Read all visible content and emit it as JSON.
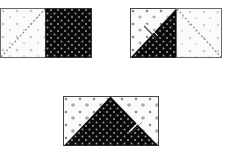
{
  "figure": {
    "colors": {
      "dark_fabric": "#0a0a0a",
      "light_fabric": "#fbfbfb",
      "outline": "#555555",
      "dot_light": "#b8b8b8",
      "dot_dark": "#9a9a9a",
      "seam_line": "#888888"
    },
    "panels": [
      {
        "id": "step-1",
        "label": "Light square with diagonal line beside dark square",
        "x": 0,
        "y": 8,
        "w": 92,
        "h": 49
      },
      {
        "id": "step-2",
        "label": "Squares stitched along the diagonal",
        "x": 130,
        "y": 8,
        "w": 92,
        "h": 49
      },
      {
        "id": "step-3",
        "label": "Pressed flying-geese unit",
        "x": 63,
        "y": 96,
        "w": 95,
        "h": 49
      }
    ]
  }
}
